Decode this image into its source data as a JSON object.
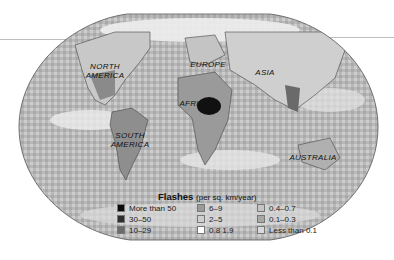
{
  "map": {
    "title": "Flashes",
    "unit": "(per sq. km/year)",
    "continent_labels": [
      {
        "name": "NORTH AMERICA",
        "lines": [
          "NORTH",
          "AMERICA"
        ]
      },
      {
        "name": "SOUTH AMERICA",
        "lines": [
          "SOUTH",
          "AMERICA"
        ]
      },
      {
        "name": "EUROPE",
        "lines": [
          "EUROPE"
        ]
      },
      {
        "name": "AFRICA",
        "lines": [
          "AFRICA"
        ]
      },
      {
        "name": "ASIA",
        "lines": [
          "ASIA"
        ]
      },
      {
        "name": "AUSTRALIA",
        "lines": [
          "AUSTRALIA"
        ]
      }
    ],
    "legend": [
      {
        "label": "More than 50",
        "color": "#0a0a0a"
      },
      {
        "label": "30–50",
        "color": "#2e2e2e"
      },
      {
        "label": "10–29",
        "color": "#6b6b6b"
      },
      {
        "label": "6–9",
        "color": "#9a9a9a"
      },
      {
        "label": "2–5",
        "color": "#cfcfcf"
      },
      {
        "label": "0.8  1.9",
        "color": "#ffffff"
      },
      {
        "label": "0.4–0.7",
        "color": "#c4c4c4"
      },
      {
        "label": "0.1–0.3",
        "color": "#a8a8a8"
      },
      {
        "label": "Less than 0.1",
        "color": "#d9d9d9"
      }
    ]
  }
}
